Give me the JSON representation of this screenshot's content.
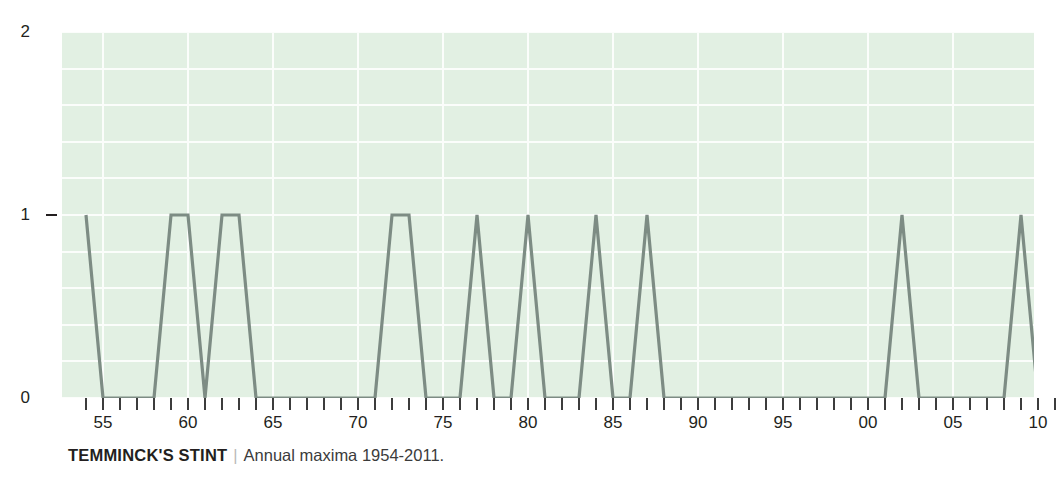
{
  "caption": {
    "title": "TEMMINCK'S STINT",
    "separator": "|",
    "subtitle": "Annual maxima 1954-2011."
  },
  "colors": {
    "plot_background": "#e2f0e3",
    "gridline": "#fbfdfb",
    "series_line": "#7d8c84",
    "axis": "#231f20",
    "caption_separator": "#b9b9b9"
  },
  "chart_data": {
    "type": "line",
    "title": "TEMMINCK'S STINT",
    "subtitle": "Annual maxima 1954-2011.",
    "xlabel": "",
    "ylabel": "",
    "ylim": [
      0,
      2
    ],
    "xlim": [
      1954,
      2011
    ],
    "grid": true,
    "legend": null,
    "y_ticks": [
      0,
      1,
      2
    ],
    "y_tick_labels": [
      "0",
      "1",
      "2"
    ],
    "x_tick_labels": [
      "55",
      "60",
      "65",
      "70",
      "75",
      "80",
      "85",
      "90",
      "95",
      "00",
      "05",
      "10"
    ],
    "x_tick_years": [
      1955,
      1960,
      1965,
      1970,
      1975,
      1980,
      1985,
      1990,
      1995,
      2000,
      2005,
      2010
    ],
    "x": [
      1954,
      1955,
      1956,
      1957,
      1958,
      1959,
      1960,
      1961,
      1962,
      1963,
      1964,
      1965,
      1966,
      1967,
      1968,
      1969,
      1970,
      1971,
      1972,
      1973,
      1974,
      1975,
      1976,
      1977,
      1978,
      1979,
      1980,
      1981,
      1982,
      1983,
      1984,
      1985,
      1986,
      1987,
      1988,
      1989,
      1990,
      1991,
      1992,
      1993,
      1994,
      1995,
      1996,
      1997,
      1998,
      1999,
      2000,
      2001,
      2002,
      2003,
      2004,
      2005,
      2006,
      2007,
      2008,
      2009,
      2010,
      2011
    ],
    "values": [
      1,
      0,
      0,
      0,
      0,
      1,
      1,
      0,
      1,
      1,
      0,
      0,
      0,
      0,
      0,
      0,
      0,
      0,
      1,
      1,
      0,
      0,
      0,
      1,
      0,
      0,
      1,
      0,
      0,
      0,
      1,
      0,
      0,
      1,
      0,
      0,
      0,
      0,
      0,
      0,
      0,
      0,
      0,
      0,
      0,
      0,
      0,
      0,
      1,
      0,
      0,
      0,
      0,
      0,
      0,
      1,
      0,
      1
    ],
    "series": [
      {
        "name": "Annual maxima",
        "values": [
          1,
          0,
          0,
          0,
          0,
          1,
          1,
          0,
          1,
          1,
          0,
          0,
          0,
          0,
          0,
          0,
          0,
          0,
          1,
          1,
          0,
          0,
          0,
          1,
          0,
          0,
          1,
          0,
          0,
          0,
          1,
          0,
          0,
          1,
          0,
          0,
          0,
          0,
          0,
          0,
          0,
          0,
          0,
          0,
          0,
          0,
          0,
          0,
          1,
          0,
          0,
          0,
          0,
          0,
          0,
          1,
          0,
          1
        ]
      }
    ]
  }
}
